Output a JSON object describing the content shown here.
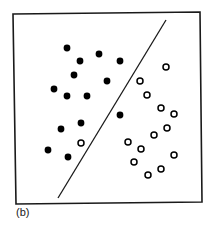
{
  "figure": {
    "panel_label": "(b)",
    "frame": {
      "points": [
        [
          13,
          14
        ],
        [
          200,
          12
        ],
        [
          202,
          202
        ],
        [
          16,
          204
        ]
      ],
      "stroke": "#1a1a1a",
      "stroke_width": 1.6
    },
    "boundary_line": {
      "x1": 58,
      "y1": 198,
      "x2": 166,
      "y2": 20,
      "stroke": "#1a1a1a",
      "stroke_width": 1.3
    },
    "marker": {
      "radius_filled": 3.4,
      "radius_open": 3.0,
      "open_stroke_width": 1.5,
      "color": "#000000"
    }
  },
  "chart_data": {
    "type": "scatter",
    "title": "",
    "xlabel": "",
    "ylabel": "",
    "legend": [],
    "grid": false,
    "annotations": [
      "(b)"
    ],
    "series": [
      {
        "name": "class-filled",
        "style": "filled-circle",
        "points": [
          [
            67,
            48
          ],
          [
            99,
            54
          ],
          [
            80,
            61
          ],
          [
            120,
            61
          ],
          [
            74,
            75
          ],
          [
            107,
            81
          ],
          [
            54,
            89
          ],
          [
            67,
            96
          ],
          [
            87,
            96
          ],
          [
            120,
            115
          ],
          [
            81,
            123
          ],
          [
            61,
            129
          ],
          [
            48,
            150
          ],
          [
            68,
            157
          ]
        ]
      },
      {
        "name": "class-open",
        "style": "open-circle",
        "points": [
          [
            166,
            67
          ],
          [
            140,
            81
          ],
          [
            147,
            95
          ],
          [
            161,
            108
          ],
          [
            174,
            114
          ],
          [
            167,
            128
          ],
          [
            154,
            135
          ],
          [
            128,
            142
          ],
          [
            141,
            149
          ],
          [
            174,
            155
          ],
          [
            134,
            162
          ],
          [
            161,
            169
          ],
          [
            148,
            175
          ],
          [
            81,
            143
          ]
        ]
      }
    ],
    "decision_boundary": {
      "type": "line",
      "from": [
        58,
        198
      ],
      "to": [
        166,
        20
      ]
    }
  }
}
